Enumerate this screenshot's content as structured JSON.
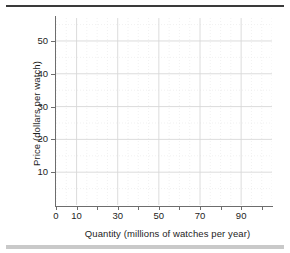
{
  "chart_data": {
    "type": "line",
    "title": "",
    "subtitle": "",
    "xlabel": "Quantity (millions of watches per year)",
    "ylabel": "Price (dollars per watch)",
    "xlim": [
      0,
      105
    ],
    "ylim": [
      0,
      57
    ],
    "grid": true,
    "legend": null,
    "series": [],
    "annotations": [],
    "x_tick_values": [
      0,
      10,
      20,
      30,
      40,
      50,
      60,
      70,
      80,
      90,
      100
    ],
    "x_tick_labels": [
      "0",
      "10",
      "",
      "30",
      "",
      "50",
      "",
      "70",
      "",
      "90",
      ""
    ],
    "y_tick_values": [
      10,
      20,
      30,
      40,
      50
    ],
    "y_tick_labels": [
      "10",
      "20",
      "30",
      "40",
      "50"
    ],
    "x_major_gridlines": [
      10,
      30,
      50,
      70,
      90
    ],
    "y_major_gridlines": [
      10,
      20,
      30,
      40,
      50
    ],
    "note": "Empty plot grid with no data series drawn"
  },
  "axes": {
    "y_title": "Price (dollars per watch)",
    "x_title": "Quantity (millions of watches per year)",
    "x_ticks": [
      {
        "value": 0,
        "label": "0"
      },
      {
        "value": 10,
        "label": "10"
      },
      {
        "value": 20,
        "label": ""
      },
      {
        "value": 30,
        "label": "30"
      },
      {
        "value": 40,
        "label": ""
      },
      {
        "value": 50,
        "label": "50"
      },
      {
        "value": 60,
        "label": ""
      },
      {
        "value": 70,
        "label": "70"
      },
      {
        "value": 80,
        "label": ""
      },
      {
        "value": 90,
        "label": "90"
      },
      {
        "value": 100,
        "label": ""
      }
    ],
    "y_ticks": [
      {
        "value": 10,
        "label": "10"
      },
      {
        "value": 20,
        "label": "20"
      },
      {
        "value": 30,
        "label": "30"
      },
      {
        "value": 40,
        "label": "40"
      },
      {
        "value": 50,
        "label": "50"
      }
    ]
  },
  "style": {
    "axis_color": "#6d6d6d",
    "text_color": "#1d1d1d",
    "major_grid_color": "#d8d8d8",
    "minor_grid_color": "#ebebeb",
    "top_rule_color": "#3a3a3a",
    "bottom_bar_color": "#c9c9c9",
    "background": "#ffffff"
  }
}
